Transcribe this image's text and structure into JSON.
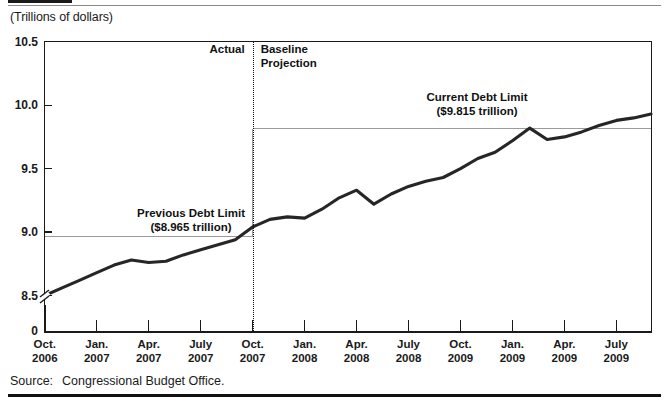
{
  "figure": {
    "units_caption": "(Trillions of dollars)",
    "source_label": "Source:",
    "source_text": "Congressional Budget Office."
  },
  "annotations": {
    "actual": "Actual",
    "baseline_line1": "Baseline",
    "baseline_line2": "Projection",
    "previous_limit_line1": "Previous Debt Limit",
    "previous_limit_line2": "($8.965 trillion)",
    "current_limit_line1": "Current Debt Limit",
    "current_limit_line2": "($9.815 trillion)"
  },
  "chart_data": {
    "type": "line",
    "title": "",
    "subtitle": "",
    "xlabel": "",
    "ylabel": "(Trillions of dollars)",
    "ylim": [
      8.42,
      10.5
    ],
    "y_axis_break": true,
    "y_tick_labels": [
      "10.5",
      "10.0",
      "9.5",
      "9.0",
      "8.5",
      "0"
    ],
    "y_tick_values": [
      10.5,
      10.0,
      9.5,
      9.0,
      8.5,
      0
    ],
    "grid": false,
    "legend_position": "none",
    "x_tick_labels": [
      "Oct.\n2006",
      "Jan.\n2007",
      "Apr.\n2007",
      "July\n2007",
      "Oct.\n2007",
      "Jan.\n2008",
      "Apr.\n2008",
      "July\n2008",
      "Oct.\n2008",
      "Jan.\n2009",
      "Apr.\n2009",
      "July\n2009"
    ],
    "x_tick_month": [
      "Oct.",
      "Jan.",
      "Apr.",
      "July",
      "Oct.",
      "Jan.",
      "Apr.",
      "July",
      "Oct.",
      "Jan.",
      "Apr.",
      "July"
    ],
    "x_tick_year": [
      "2006",
      "2007",
      "2007",
      "2007",
      "2007",
      "2008",
      "2008",
      "2008",
      "2009",
      "2009",
      "2009",
      "2009"
    ],
    "series": [
      {
        "name": "Debt Subject to Limit",
        "color": "#262626",
        "x": [
          "2006-10",
          "2006-11",
          "2006-12",
          "2007-01",
          "2007-02",
          "2007-03",
          "2007-04",
          "2007-05",
          "2007-06",
          "2007-07",
          "2007-08",
          "2007-09",
          "2007-10",
          "2007-11",
          "2007-12",
          "2008-01",
          "2008-02",
          "2008-03",
          "2008-04",
          "2008-05",
          "2008-06",
          "2008-07",
          "2008-08",
          "2008-09",
          "2008-10",
          "2008-11",
          "2008-12",
          "2009-01",
          "2009-02",
          "2009-03",
          "2009-04",
          "2009-05",
          "2009-06",
          "2009-07",
          "2009-08",
          "2009-09"
        ],
        "values": [
          8.5,
          8.56,
          8.62,
          8.68,
          8.74,
          8.78,
          8.76,
          8.77,
          8.82,
          8.86,
          8.9,
          8.94,
          9.04,
          9.1,
          9.12,
          9.11,
          9.18,
          9.27,
          9.33,
          9.22,
          9.3,
          9.36,
          9.4,
          9.43,
          9.5,
          9.58,
          9.63,
          9.72,
          9.82,
          9.73,
          9.75,
          9.79,
          9.84,
          9.88,
          9.9,
          9.93
        ]
      }
    ],
    "reference_lines": [
      {
        "name": "Previous Debt Limit",
        "value": 8.965,
        "label": "($8.965 trillion)",
        "x_start": "2006-10",
        "x_end": "2007-10",
        "color": "#9a9a9a"
      },
      {
        "name": "Current Debt Limit",
        "value": 9.815,
        "label": "($9.815 trillion)",
        "x_start": "2007-10",
        "x_end": "2009-09",
        "color": "#9a9a9a"
      }
    ],
    "divider": {
      "name": "actual-vs-projection-divider",
      "x": "2007-10",
      "left_label": "Actual",
      "right_label": "Baseline Projection",
      "style": "dotted"
    }
  }
}
